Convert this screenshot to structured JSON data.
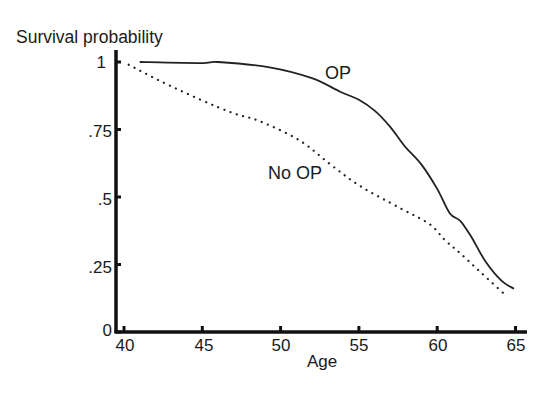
{
  "chart_data": {
    "type": "line",
    "title": "",
    "xlabel": "Age",
    "ylabel": "Survival probability",
    "xlim": [
      40,
      65
    ],
    "ylim": [
      0,
      1
    ],
    "x_ticks": [
      40,
      45,
      50,
      55,
      60,
      65
    ],
    "x_tick_labels": [
      "40",
      "45",
      "50",
      "55",
      "60",
      "65"
    ],
    "y_ticks": [
      0,
      0.25,
      0.5,
      0.75,
      1
    ],
    "y_tick_labels": [
      "0",
      ".25",
      ".5",
      ".75",
      "1"
    ],
    "grid": false,
    "legend": "inline labels",
    "series": [
      {
        "name": "OP",
        "style": "solid",
        "x": [
          41.0,
          44.9,
          46.0,
          49.3,
          52.0,
          53.8,
          55.0,
          56.0,
          57.0,
          57.9,
          59.0,
          60.0,
          60.8,
          61.5,
          62.2,
          63.1,
          64.1,
          64.9
        ],
        "y": [
          1.0,
          0.996,
          1.0,
          0.98,
          0.94,
          0.89,
          0.86,
          0.82,
          0.76,
          0.69,
          0.62,
          0.53,
          0.44,
          0.41,
          0.35,
          0.26,
          0.19,
          0.16
        ]
      },
      {
        "name": "No OP",
        "style": "dotted",
        "x": [
          40.3,
          42.3,
          44.9,
          47.0,
          48.7,
          51.2,
          53.2,
          55.1,
          57.6,
          59.5,
          60.5,
          61.5,
          62.8,
          64.3
        ],
        "y": [
          0.99,
          0.93,
          0.86,
          0.81,
          0.78,
          0.71,
          0.62,
          0.54,
          0.46,
          0.4,
          0.34,
          0.29,
          0.22,
          0.14
        ]
      }
    ],
    "annotations": [
      {
        "text": "OP",
        "x": 54.2,
        "y": 0.96
      },
      {
        "text": "No OP",
        "x": 49.5,
        "y": 0.58
      }
    ]
  },
  "labels": {
    "ylabel": "Survival probability",
    "xlabel": "Age",
    "op": "OP",
    "no_op": "No OP",
    "y0": "0",
    "y25": ".25",
    "y50": ".5",
    "y75": ".75",
    "y100": "1",
    "x40": "40",
    "x45": "45",
    "x50": "50",
    "x55": "55",
    "x60": "60",
    "x65": "65"
  },
  "colors": {
    "axis": "#111111",
    "line": "#222222"
  }
}
